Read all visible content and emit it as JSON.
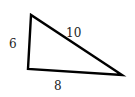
{
  "diagram": {
    "type": "right-triangle",
    "stroke_color": "#000000",
    "background": "#ffffff",
    "vertices": {
      "top": [
        31,
        15
      ],
      "bottom_left": [
        28,
        69
      ],
      "right": [
        122,
        75
      ]
    },
    "sides": {
      "left": {
        "label": "6"
      },
      "hypotenuse": {
        "label": "10"
      },
      "bottom": {
        "label": "8"
      }
    }
  }
}
